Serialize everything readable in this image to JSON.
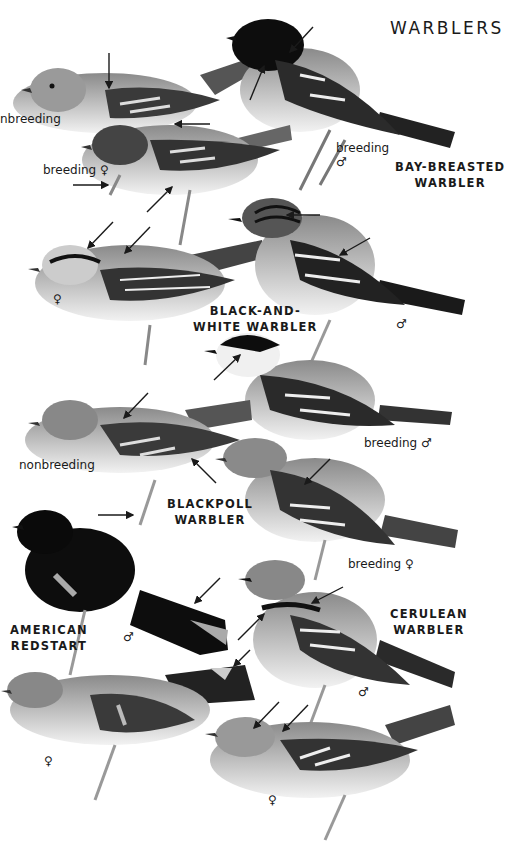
{
  "page": {
    "title": "WARBLERS"
  },
  "species": [
    {
      "id": "bay-breasted",
      "name_line1": "BAY-BREASTED",
      "name_line2": "WARBLER",
      "plumages": [
        "nonbreeding",
        "breeding ♀",
        "breeding ♂"
      ]
    },
    {
      "id": "black-and-white",
      "name_line1": "BLACK-AND-",
      "name_line2": "WHITE WARBLER",
      "plumages": [
        "♀",
        "♂"
      ]
    },
    {
      "id": "blackpoll",
      "name_line1": "BLACKPOLL",
      "name_line2": "WARBLER",
      "plumages": [
        "nonbreeding",
        "breeding ♂",
        "breeding ♀"
      ]
    },
    {
      "id": "american-redstart",
      "name_line1": "AMERICAN",
      "name_line2": "REDSTART",
      "plumages": [
        "♂",
        "♀"
      ]
    },
    {
      "id": "cerulean",
      "name_line1": "CERULEAN",
      "name_line2": "WARBLER",
      "plumages": [
        "♂",
        "♀"
      ]
    }
  ],
  "labels": {
    "bb_nonbreeding": "nbreeding",
    "bb_breeding_f": "breeding ♀",
    "bb_breeding_m_1": "breeding",
    "bb_breeding_m_2": "♂",
    "bw_female": "♀",
    "bw_male": "♂",
    "bp_breeding_m": "breeding ♂",
    "bp_nonbreeding": "nonbreeding",
    "bp_breeding_f": "breeding ♀",
    "ar_male": "♂",
    "ar_female": "♀",
    "ce_male": "♂",
    "ce_female": "♀"
  },
  "colors": {
    "ink": "#1a1a1a",
    "dark": "#111111",
    "mid": "#6b6b6b",
    "light": "#a8a8a8",
    "pale": "#e6e6e6"
  }
}
